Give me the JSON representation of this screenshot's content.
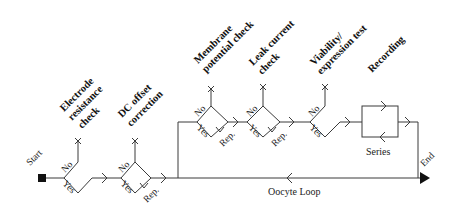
{
  "diagram": {
    "start_label": "Start",
    "end_label": "End",
    "loop_label": "Oocyte Loop",
    "series_label": "Series",
    "steps": [
      {
        "id": "electrode",
        "title_lines": [
          "Electrode",
          "resistance",
          "check"
        ],
        "no": "No",
        "yes": "Yes"
      },
      {
        "id": "dc-offset",
        "title_lines": [
          "DC offset",
          "correction"
        ],
        "no": "No",
        "yes": "Yes",
        "rep": "Rep."
      },
      {
        "id": "membrane",
        "title_lines": [
          "Membrane",
          "potential check"
        ],
        "no": "No",
        "yes": "Yes",
        "rep": "Rep."
      },
      {
        "id": "leak",
        "title_lines": [
          "Leak current",
          "check"
        ],
        "no": "No",
        "yes": "Yes",
        "rep": "Rep."
      },
      {
        "id": "viability",
        "title_lines": [
          "Viability/",
          "expression test"
        ],
        "no": "No",
        "yes": "Yes"
      },
      {
        "id": "recording",
        "title_lines": [
          "Recording"
        ]
      }
    ],
    "colors": {
      "line": "#3a3a3a",
      "text": "#111111",
      "background": "#ffffff"
    }
  }
}
